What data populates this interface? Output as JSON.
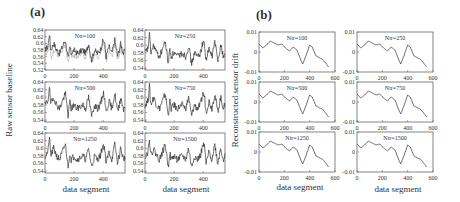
{
  "figure": {
    "panel_a_label": "(a)",
    "panel_b_label": "(b)",
    "panel_a_ylabel": "Raw sensor baseline",
    "panel_b_ylabel": "Reconstructed sensor drift",
    "xlabel": "data segment"
  },
  "chart_data": [
    {
      "type": "line",
      "panel": "(a)",
      "title": "Raw sensor baseline vs data segment",
      "xlabel": "data segment",
      "ylabel": "Raw sensor baseline",
      "xlim": [
        0,
        550
      ],
      "xticks": [
        0,
        200,
        400
      ],
      "layout": "3x2 subplots",
      "subplots": [
        {
          "title": "Ntr=100",
          "ylim": [
            0.52,
            0.64
          ],
          "yticks": [
            0.52,
            0.54,
            0.56,
            0.58,
            0.6,
            0.62,
            0.64
          ],
          "series": [
            {
              "name": "baseline",
              "color": "#333333"
            },
            {
              "name": "reference (light)",
              "color": "#aaaaaa"
            }
          ]
        },
        {
          "title": "Ntr=250",
          "ylim": [
            0.535,
            0.64
          ],
          "yticks": [
            0.54,
            0.56,
            0.58,
            0.6,
            0.62,
            0.64
          ]
        },
        {
          "title": "Ntr=500",
          "ylim": [
            0.535,
            0.64
          ],
          "yticks": [
            0.54,
            0.56,
            0.58,
            0.6,
            0.62,
            0.64
          ]
        },
        {
          "title": "Ntr=750",
          "ylim": [
            0.535,
            0.64
          ],
          "yticks": [
            0.54,
            0.56,
            0.58,
            0.6,
            0.62,
            0.64
          ]
        },
        {
          "title": "Ntr=1250",
          "ylim": [
            0.535,
            0.64
          ],
          "yticks": [
            0.54,
            0.56,
            0.58,
            0.6,
            0.62,
            0.64
          ]
        },
        {
          "title": "Ntr=1500",
          "ylim": [
            0.535,
            0.64
          ],
          "yticks": [
            0.54,
            0.56,
            0.58,
            0.6,
            0.62,
            0.64
          ]
        }
      ],
      "approx_signal": {
        "x": [
          0,
          20,
          30,
          40,
          60,
          80,
          100,
          120,
          140,
          160,
          170,
          180,
          200,
          220,
          240,
          260,
          280,
          300,
          320,
          340,
          360,
          380,
          400,
          410,
          420,
          440,
          460,
          480,
          500,
          520,
          540,
          550
        ],
        "y": [
          0.58,
          0.59,
          0.63,
          0.58,
          0.6,
          0.58,
          0.57,
          0.59,
          0.61,
          0.55,
          0.59,
          0.57,
          0.58,
          0.57,
          0.575,
          0.58,
          0.57,
          0.6,
          0.55,
          0.58,
          0.57,
          0.58,
          0.61,
          0.6,
          0.56,
          0.59,
          0.57,
          0.61,
          0.56,
          0.6,
          0.57,
          0.58
        ]
      }
    },
    {
      "type": "line",
      "panel": "(b)",
      "title": "Reconstructed sensor drift vs data segment",
      "xlabel": "data segment",
      "ylabel": "Reconstructed sensor drift",
      "xlim": [
        0,
        600
      ],
      "xticks": [
        0,
        200,
        400,
        600
      ],
      "ylim": [
        -0.01,
        0.01
      ],
      "yticks": [
        -0.01,
        0,
        0.01
      ],
      "layout": "3x2 subplots",
      "subplots": [
        {
          "title": "Ntr=100"
        },
        {
          "title": "Ntr=250"
        },
        {
          "title": "Ntr=500"
        },
        {
          "title": "Ntr=750"
        },
        {
          "title": "Ntr=1250"
        },
        {
          "title": "Ntr=1500"
        }
      ],
      "approx_signal": {
        "x": [
          0,
          30,
          60,
          90,
          120,
          150,
          180,
          210,
          240,
          270,
          300,
          330,
          345,
          370,
          400,
          420,
          450,
          480,
          500,
          520,
          550
        ],
        "y": [
          0.004,
          0.002,
          0.0035,
          0.0055,
          0.0045,
          0.0035,
          0.004,
          0.002,
          0.0005,
          0.0025,
          0.001,
          -0.004,
          -0.006,
          -0.002,
          0.0035,
          0.0025,
          -0.002,
          -0.003,
          -0.0035,
          -0.005,
          -0.0075
        ]
      }
    }
  ]
}
